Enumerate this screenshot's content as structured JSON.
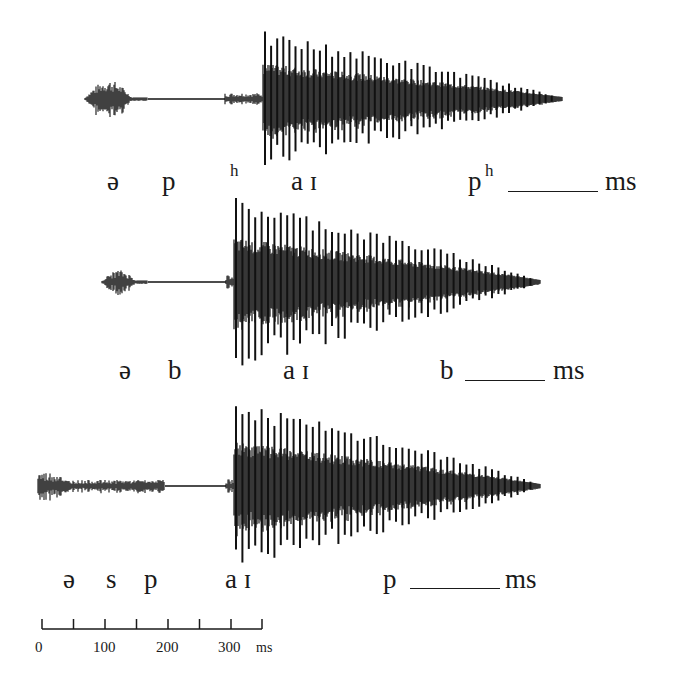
{
  "figure": {
    "rows": [
      {
        "id": "aspirated",
        "segments": [
          "ə",
          "p",
          "h",
          "a ɪ",
          "p",
          "h"
        ],
        "labels": {
          "schwa": "ə",
          "stop": "p",
          "aspiration": "h",
          "diphthong": "a ɪ",
          "final": "p",
          "final_sup": "h",
          "unit": "ms"
        },
        "waveform": {
          "baseline_y": 99,
          "start_x": 85,
          "burst_end_x": 148,
          "closure_end_x": 225,
          "voicing_start_x": 263,
          "end_x": 562,
          "peak_amp": 62
        }
      },
      {
        "id": "voiced",
        "labels": {
          "schwa": "ə",
          "stop": "b",
          "diphthong": "a ɪ",
          "final": "b",
          "unit": "ms"
        },
        "waveform": {
          "baseline_y": 282,
          "start_x": 102,
          "burst_end_x": 148,
          "closure_end_x": 226,
          "voicing_start_x": 234,
          "end_x": 540,
          "peak_amp": 78
        }
      },
      {
        "id": "s-cluster",
        "labels": {
          "schwa": "ə",
          "fricative": "s",
          "stop": "p",
          "diphthong": "a ɪ",
          "final": "p",
          "unit": "ms"
        },
        "waveform": {
          "baseline_y": 486,
          "start_x": 38,
          "burst_end_x": 165,
          "closure_end_x": 226,
          "voicing_start_x": 234,
          "end_x": 540,
          "peak_amp": 78
        }
      }
    ],
    "scale": {
      "tick_labels": [
        "0",
        "100",
        "200",
        "300"
      ],
      "unit": "ms",
      "range_ms": [
        0,
        350
      ],
      "tick_interval_ms": 50
    }
  }
}
